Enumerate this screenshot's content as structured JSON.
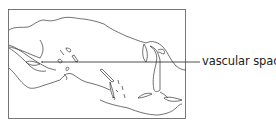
{
  "diagram": {
    "type": "histology-line-drawing",
    "labels": [
      {
        "text": "vascular spaces",
        "leader_from": [
          42,
          62
        ],
        "leader_to": [
          200,
          62
        ]
      }
    ],
    "colors": {
      "line": "#333333",
      "frame": "#555555",
      "text": "#222222"
    }
  }
}
